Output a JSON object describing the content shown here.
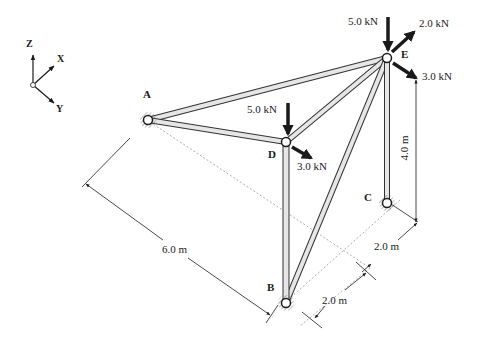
{
  "figure": {
    "type": "space-truss",
    "axes": {
      "z": "Z",
      "x": "X",
      "y": "Y"
    },
    "nodes": {
      "A": "A",
      "B": "B",
      "C": "C",
      "D": "D",
      "E": "E"
    },
    "members": [
      "AE",
      "AD",
      "DE",
      "DB",
      "BE",
      "CE"
    ],
    "loads": {
      "E_down": "5.0 kN",
      "E_x": "2.0 kN",
      "E_y": "3.0 kN",
      "D_down": "5.0 kN",
      "D_y": "3.0 kN"
    },
    "dimensions": {
      "AB": "6.0 m",
      "height_CE": "4.0 m",
      "C_offset": "2.0 m",
      "B_offset": "2.0 m"
    },
    "colors": {
      "member_fill": "#e6e6e6",
      "member_edge": "#333333",
      "ink": "#1a1a1a"
    }
  }
}
